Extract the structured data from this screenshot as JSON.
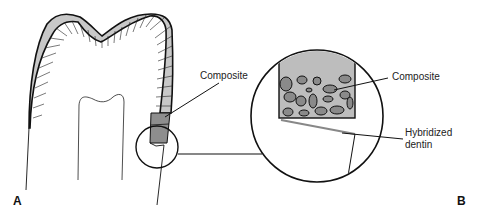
{
  "figure": {
    "panel_a": {
      "letter": "A"
    },
    "panel_b": {
      "letter": "B"
    },
    "labels": {
      "composite_a": "Composite",
      "composite_b": "Composite",
      "hybridized_line1": "Hybridized",
      "hybridized_line2": "dentin"
    },
    "colors": {
      "enamel_fill": "#c8c8c8",
      "composite_fill": "#8e8e8e",
      "matrix_fill": "#bdbdbd",
      "filler_fill": "#8a8a8a",
      "stroke": "#111111"
    }
  }
}
